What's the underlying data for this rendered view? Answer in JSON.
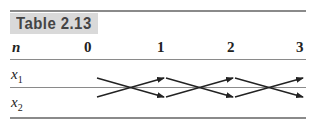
{
  "table": {
    "title": "Table 2.13",
    "header": {
      "label": "n",
      "columns": [
        "0",
        "1",
        "2",
        "3"
      ]
    },
    "rows": [
      {
        "var": "x",
        "sub": "1"
      },
      {
        "var": "x",
        "sub": "2"
      }
    ],
    "diagram": "crossing arrows between x1 and x2 from n=0 to n=3"
  }
}
